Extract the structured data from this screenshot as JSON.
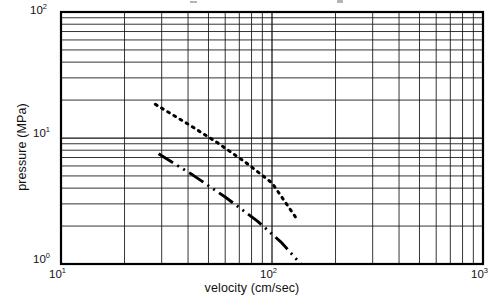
{
  "figure": {
    "name": "pressure-velocity-log-log-plot"
  },
  "axes": {
    "x_label": "velocity (cm/sec)",
    "y_label": "pressure (MPa)",
    "x_ticks": [
      {
        "id": "x1",
        "mantissa": "10",
        "exponent": "1",
        "value": 10
      },
      {
        "id": "x2",
        "mantissa": "10",
        "exponent": "2",
        "value": 100
      },
      {
        "id": "x3",
        "mantissa": "10",
        "exponent": "3",
        "value": 1000
      }
    ],
    "y_ticks": [
      {
        "id": "y2",
        "mantissa": "10",
        "exponent": "2",
        "value": 100
      },
      {
        "id": "y1",
        "mantissa": "10",
        "exponent": "1",
        "value": 10
      },
      {
        "id": "y0",
        "mantissa": "10",
        "exponent": "0",
        "value": 1
      }
    ]
  },
  "chart_data": {
    "type": "line",
    "title": "",
    "xlabel": "velocity (cm/sec)",
    "ylabel": "pressure (MPa)",
    "xscale": "log",
    "yscale": "log",
    "xlim": [
      10,
      1000
    ],
    "ylim": [
      1,
      100
    ],
    "grid": true,
    "grid_minor": true,
    "legend": "none",
    "series": [
      {
        "name": "upper-curve",
        "style": "dotted",
        "color": "#000000",
        "x": [
          28.0,
          133.0
        ],
        "y": [
          18.5,
          2.2
        ],
        "points": [
          {
            "x": 28.0,
            "y": 18.5
          },
          {
            "x": 40.0,
            "y": 12.9
          },
          {
            "x": 55.0,
            "y": 9.2
          },
          {
            "x": 75.0,
            "y": 6.4
          },
          {
            "x": 100.0,
            "y": 4.4
          },
          {
            "x": 133.0,
            "y": 2.2
          }
        ]
      },
      {
        "name": "lower-curve",
        "style": "dash-dot",
        "color": "#000000",
        "x": [
          29.0,
          137.0
        ],
        "y": [
          7.5,
          1.0
        ],
        "points": [
          {
            "x": 29.0,
            "y": 7.5
          },
          {
            "x": 42.0,
            "y": 5.1
          },
          {
            "x": 60.0,
            "y": 3.4
          },
          {
            "x": 85.0,
            "y": 2.2
          },
          {
            "x": 110.0,
            "y": 1.5
          },
          {
            "x": 137.0,
            "y": 1.0
          }
        ]
      }
    ]
  },
  "geometry": {
    "plot_left": 61,
    "plot_right": 483,
    "plot_top": 12,
    "plot_bottom": 264
  }
}
